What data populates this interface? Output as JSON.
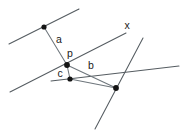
{
  "figure": {
    "background_color": "#ffffff",
    "line_color": "#555c61",
    "segment_color": "#6e767c",
    "vertex_color": "#141414",
    "label_color": "#1a1a1a",
    "labels": [
      {
        "id": "label-x",
        "text": "x",
        "x": 127,
        "y": 26
      },
      {
        "id": "label-a",
        "text": "a",
        "x": 59,
        "y": 40
      },
      {
        "id": "label-p",
        "text": "p",
        "x": 70,
        "y": 54
      },
      {
        "id": "label-b",
        "text": "b",
        "x": 91,
        "y": 66
      },
      {
        "id": "label-c",
        "text": "c",
        "x": 60,
        "y": 74
      }
    ],
    "lines": [
      {
        "id": "line-upper-left",
        "x1": 9,
        "y1": 44,
        "x2": 79,
        "y2": 9
      },
      {
        "id": "line-x",
        "x1": 10,
        "y1": 92,
        "x2": 126,
        "y2": 33
      },
      {
        "id": "line-steep-right",
        "x1": 143,
        "y1": 38,
        "x2": 95,
        "y2": 129
      },
      {
        "id": "line-lower-right",
        "x1": 51,
        "y1": 81,
        "x2": 179,
        "y2": 66
      }
    ],
    "segments": [
      {
        "id": "segment-a",
        "x1": 44,
        "y1": 27,
        "x2": 67,
        "y2": 65
      },
      {
        "id": "segment-c",
        "x1": 67,
        "y1": 65,
        "x2": 70,
        "y2": 79
      },
      {
        "id": "segment-b",
        "x1": 67,
        "y1": 65,
        "x2": 116,
        "y2": 88
      },
      {
        "id": "segment-base",
        "x1": 70,
        "y1": 79,
        "x2": 116,
        "y2": 88
      }
    ],
    "vertices": [
      {
        "id": "vertex-top",
        "x": 44,
        "y": 27,
        "r": 2.6
      },
      {
        "id": "vertex-p",
        "x": 67,
        "y": 65,
        "r": 2.9
      },
      {
        "id": "vertex-c",
        "x": 70,
        "y": 79,
        "r": 2.6
      },
      {
        "id": "vertex-right",
        "x": 116,
        "y": 88,
        "r": 2.9
      }
    ]
  }
}
